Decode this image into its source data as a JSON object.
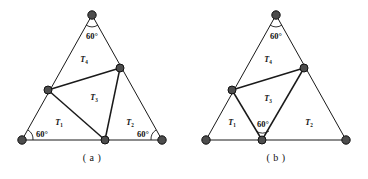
{
  "figure": {
    "panels": [
      {
        "id": "a",
        "caption": "( a )",
        "angles": [
          {
            "name": "apex",
            "text": "60°"
          },
          {
            "name": "bottom-left",
            "text": "60°"
          },
          {
            "name": "bottom-right",
            "text": "60°"
          }
        ],
        "regions": [
          {
            "name": "top",
            "label": "T",
            "sub": "4"
          },
          {
            "name": "center",
            "label": "T",
            "sub": "3"
          },
          {
            "name": "lower-left",
            "label": "T",
            "sub": "1"
          },
          {
            "name": "lower-right",
            "label": "T",
            "sub": "2"
          }
        ]
      },
      {
        "id": "b",
        "caption": "( b )",
        "angles": [
          {
            "name": "apex",
            "text": "60°"
          },
          {
            "name": "inner-bottom",
            "text": "60°"
          }
        ],
        "regions": [
          {
            "name": "top",
            "label": "T",
            "sub": "4"
          },
          {
            "name": "center",
            "label": "T",
            "sub": "3"
          },
          {
            "name": "lower-left",
            "label": "T",
            "sub": "1"
          },
          {
            "name": "lower-right",
            "label": "T",
            "sub": "2"
          }
        ]
      }
    ],
    "colors": {
      "line": "#1a1a1a",
      "vertex_fill": "#4d4d4d",
      "vertex_stroke": "#111111",
      "background": "#ffffff"
    }
  }
}
